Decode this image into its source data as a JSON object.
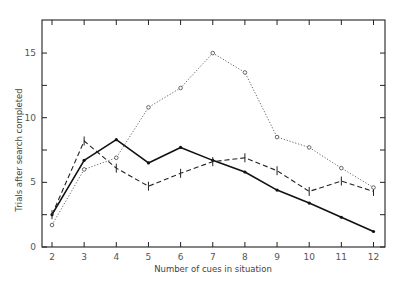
{
  "chart_data": {
    "type": "line",
    "title": "",
    "xlabel": "Number of cues in situation",
    "ylabel": "Trials after search completed",
    "x": [
      2,
      3,
      4,
      5,
      6,
      7,
      8,
      9,
      10,
      11,
      12
    ],
    "xlim": [
      1.7,
      12.4
    ],
    "ylim": [
      0,
      17.4
    ],
    "yticks": [
      0,
      5,
      10,
      15
    ],
    "yticks_minor": [
      2.5,
      7.5,
      12.5
    ],
    "xticks": [
      2,
      3,
      4,
      5,
      6,
      7,
      8,
      9,
      10,
      11,
      12
    ],
    "grid": false,
    "legend": null,
    "series": [
      {
        "name": "solid-star",
        "style": "solid",
        "marker": "star",
        "values": [
          2.5,
          6.7,
          8.3,
          6.5,
          7.7,
          6.7,
          5.8,
          4.4,
          3.4,
          2.3,
          1.2
        ]
      },
      {
        "name": "dashed-tick",
        "style": "dashed",
        "marker": "vertical-tick",
        "values": [
          2.5,
          8.2,
          6.1,
          4.7,
          5.7,
          6.6,
          6.9,
          5.9,
          4.3,
          5.1,
          4.3
        ]
      },
      {
        "name": "dotted-circle",
        "style": "dotted",
        "marker": "circle",
        "values": [
          1.7,
          6.0,
          6.9,
          10.8,
          12.3,
          15.0,
          13.5,
          8.5,
          7.7,
          6.1,
          4.6
        ]
      }
    ]
  },
  "axes": {
    "x_label": "Number of cues in situation",
    "y_label": "Trials after search completed",
    "x_tick_labels": [
      "2",
      "3",
      "4",
      "5",
      "6",
      "7",
      "8",
      "9",
      "10",
      "11",
      "12"
    ],
    "y_tick_labels": [
      "0",
      "5",
      "10",
      "15"
    ]
  }
}
